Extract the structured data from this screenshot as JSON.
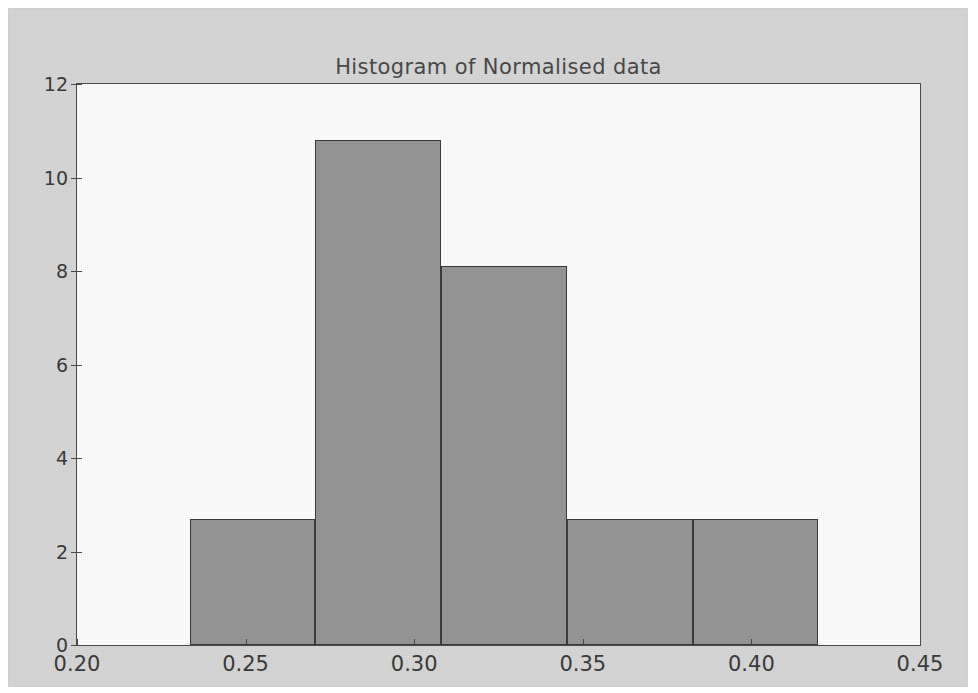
{
  "figure": {
    "background_color": "#d8d8d8",
    "axes_background_color": "#ffffff",
    "axes_edge_color": "#4c4c4c"
  },
  "chart_data": {
    "type": "bar",
    "title": "Histogram of Normalised data",
    "xlabel": "",
    "ylabel": "",
    "xlim": [
      0.2,
      0.45
    ],
    "ylim": [
      0,
      12
    ],
    "grid": false,
    "legend": null,
    "bar_color": "#979797",
    "bar_edge_color": "#3c3c3c",
    "xticks": [
      0.2,
      0.25,
      0.3,
      0.35,
      0.4,
      0.45
    ],
    "xtick_labels": [
      "0.20",
      "0.25",
      "0.30",
      "0.35",
      "0.40",
      "0.45"
    ],
    "yticks": [
      0,
      2,
      4,
      6,
      8,
      10,
      12
    ],
    "ytick_labels": [
      "0",
      "2",
      "4",
      "6",
      "8",
      "10",
      "12"
    ],
    "bin_edges": [
      0.2334,
      0.2707,
      0.308,
      0.3453,
      0.3826,
      0.4198
    ],
    "categories": [
      "0.233-0.271",
      "0.271-0.308",
      "0.308-0.345",
      "0.345-0.383",
      "0.383-0.420"
    ],
    "values": [
      2.7,
      10.8,
      8.1,
      2.7,
      2.7
    ]
  }
}
